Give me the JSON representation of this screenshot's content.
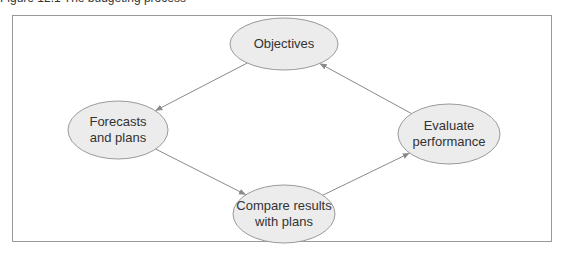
{
  "caption": "Figure 12.1 The budgeting process",
  "colors": {
    "node_fill": "#ececec",
    "node_stroke": "#9a9a9a",
    "arrow": "#8a8a8a",
    "frame": "#999999",
    "text": "#333333"
  },
  "nodes": [
    {
      "id": "objectives",
      "label": "Objectives",
      "cx": 284,
      "cy": 44,
      "rx": 54,
      "ry": 26
    },
    {
      "id": "forecasts",
      "label": "Forecasts\nand plans",
      "cx": 118,
      "cy": 130,
      "rx": 50,
      "ry": 29
    },
    {
      "id": "evaluate",
      "label": "Evaluate\nperformance",
      "cx": 449,
      "cy": 134,
      "rx": 51,
      "ry": 30
    },
    {
      "id": "compare",
      "label": "Compare results\nwith plans",
      "cx": 284,
      "cy": 214,
      "rx": 51,
      "ry": 29
    }
  ],
  "edges": [
    {
      "from": "objectives",
      "to": "forecasts"
    },
    {
      "from": "forecasts",
      "to": "compare"
    },
    {
      "from": "compare",
      "to": "evaluate"
    },
    {
      "from": "evaluate",
      "to": "objectives"
    }
  ]
}
